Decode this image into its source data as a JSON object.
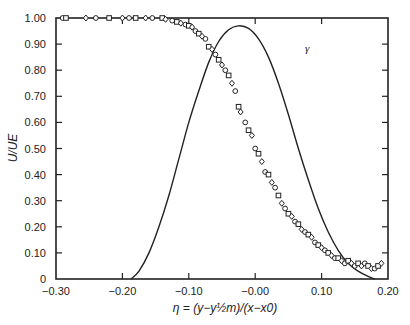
{
  "chart_data": {
    "type": "scatter",
    "title": "",
    "xlabel": "η = (y−y½m)/(x−x0)",
    "ylabel": "U/UE",
    "xlim": [
      -0.3,
      0.2
    ],
    "ylim": [
      0,
      1.0
    ],
    "grid": false,
    "legend": "none",
    "x_ticks": [
      -0.3,
      -0.2,
      -0.1,
      0.0,
      0.1,
      0.2
    ],
    "x_tick_labels": [
      "−0.30",
      "−0.20",
      "−0.10",
      "−0.00",
      "0.10",
      "0.20"
    ],
    "y_ticks": [
      0,
      0.1,
      0.2,
      0.3,
      0.4,
      0.5,
      0.6,
      0.7,
      0.8,
      0.9,
      1.0
    ],
    "y_tick_labels": [
      "0",
      "0.10",
      "0.20",
      "0.30",
      "0.40",
      "0.50",
      "0.60",
      "0.70",
      "0.80",
      "0.90",
      "1.00"
    ],
    "series": [
      {
        "name": "U/UE measurements",
        "kind": "scatter",
        "markers": [
          "circle",
          "square",
          "diamond"
        ],
        "points": [
          [
            -0.29,
            1.0
          ],
          [
            -0.285,
            1.0
          ],
          [
            -0.255,
            1.0
          ],
          [
            -0.24,
            1.0
          ],
          [
            -0.22,
            1.0
          ],
          [
            -0.2,
            1.0
          ],
          [
            -0.19,
            1.0
          ],
          [
            -0.18,
            1.0
          ],
          [
            -0.165,
            1.0
          ],
          [
            -0.155,
            1.0
          ],
          [
            -0.14,
            1.0
          ],
          [
            -0.135,
            0.995
          ],
          [
            -0.125,
            0.99
          ],
          [
            -0.118,
            0.985
          ],
          [
            -0.112,
            0.98
          ],
          [
            -0.105,
            0.975
          ],
          [
            -0.1,
            0.97
          ],
          [
            -0.095,
            0.965
          ],
          [
            -0.09,
            0.95
          ],
          [
            -0.085,
            0.94
          ],
          [
            -0.08,
            0.93
          ],
          [
            -0.075,
            0.92
          ],
          [
            -0.07,
            0.89
          ],
          [
            -0.065,
            0.88
          ],
          [
            -0.06,
            0.86
          ],
          [
            -0.055,
            0.84
          ],
          [
            -0.05,
            0.82
          ],
          [
            -0.045,
            0.8
          ],
          [
            -0.04,
            0.78
          ],
          [
            -0.035,
            0.75
          ],
          [
            -0.03,
            0.72
          ],
          [
            -0.025,
            0.66
          ],
          [
            -0.022,
            0.64
          ],
          [
            -0.015,
            0.6
          ],
          [
            -0.01,
            0.57
          ],
          [
            -0.005,
            0.55
          ],
          [
            0.0,
            0.5
          ],
          [
            0.005,
            0.48
          ],
          [
            0.01,
            0.45
          ],
          [
            0.015,
            0.41
          ],
          [
            0.02,
            0.4
          ],
          [
            0.025,
            0.37
          ],
          [
            0.03,
            0.35
          ],
          [
            0.035,
            0.32
          ],
          [
            0.04,
            0.29
          ],
          [
            0.045,
            0.27
          ],
          [
            0.05,
            0.25
          ],
          [
            0.055,
            0.24
          ],
          [
            0.06,
            0.22
          ],
          [
            0.065,
            0.21
          ],
          [
            0.07,
            0.19
          ],
          [
            0.075,
            0.18
          ],
          [
            0.08,
            0.17
          ],
          [
            0.085,
            0.16
          ],
          [
            0.09,
            0.14
          ],
          [
            0.095,
            0.13
          ],
          [
            0.1,
            0.12
          ],
          [
            0.105,
            0.11
          ],
          [
            0.11,
            0.1
          ],
          [
            0.115,
            0.09
          ],
          [
            0.12,
            0.08
          ],
          [
            0.125,
            0.08
          ],
          [
            0.13,
            0.07
          ],
          [
            0.135,
            0.06
          ],
          [
            0.14,
            0.07
          ],
          [
            0.145,
            0.06
          ],
          [
            0.15,
            0.05
          ],
          [
            0.155,
            0.06
          ],
          [
            0.16,
            0.05
          ],
          [
            0.165,
            0.06
          ],
          [
            0.17,
            0.05
          ],
          [
            0.175,
            0.04
          ],
          [
            0.18,
            0.04
          ],
          [
            0.185,
            0.05
          ],
          [
            0.19,
            0.06
          ]
        ]
      },
      {
        "name": "γ",
        "kind": "line",
        "points": [
          [
            -0.187,
            0.0
          ],
          [
            -0.175,
            0.03
          ],
          [
            -0.16,
            0.1
          ],
          [
            -0.145,
            0.2
          ],
          [
            -0.13,
            0.32
          ],
          [
            -0.115,
            0.46
          ],
          [
            -0.1,
            0.6
          ],
          [
            -0.085,
            0.72
          ],
          [
            -0.07,
            0.83
          ],
          [
            -0.055,
            0.91
          ],
          [
            -0.04,
            0.955
          ],
          [
            -0.025,
            0.97
          ],
          [
            -0.01,
            0.96
          ],
          [
            0.005,
            0.92
          ],
          [
            0.02,
            0.85
          ],
          [
            0.035,
            0.75
          ],
          [
            0.05,
            0.63
          ],
          [
            0.065,
            0.5
          ],
          [
            0.08,
            0.38
          ],
          [
            0.095,
            0.27
          ],
          [
            0.11,
            0.18
          ],
          [
            0.125,
            0.11
          ],
          [
            0.14,
            0.06
          ],
          [
            0.155,
            0.03
          ],
          [
            0.17,
            0.01
          ],
          [
            0.18,
            0.0
          ]
        ]
      }
    ],
    "annotations": [
      {
        "text": "γ",
        "x": 0.075,
        "y": 0.87
      }
    ]
  }
}
